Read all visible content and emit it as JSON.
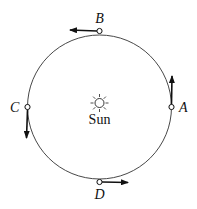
{
  "diagram": {
    "center_label": "Sun",
    "points": [
      {
        "id": "A",
        "label": "A",
        "position": "right",
        "arrow": "up"
      },
      {
        "id": "B",
        "label": "B",
        "position": "top",
        "arrow": "left"
      },
      {
        "id": "C",
        "label": "C",
        "position": "left",
        "arrow": "down"
      },
      {
        "id": "D",
        "label": "D",
        "position": "bottom",
        "arrow": "right"
      }
    ],
    "colors": {
      "line": "#222222",
      "background": "#ffffff"
    }
  }
}
